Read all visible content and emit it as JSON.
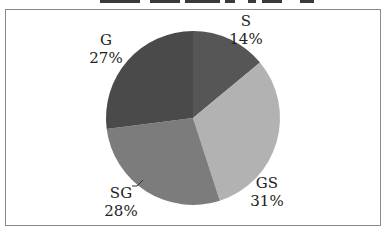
{
  "chart_data": {
    "type": "pie",
    "title": "",
    "categories": [
      "S",
      "GS",
      "SG",
      "G"
    ],
    "values": [
      14,
      31,
      28,
      27
    ],
    "unit": "%",
    "start_angle": "12 o'clock, clockwise",
    "colors": [
      "#565656",
      "#b2b2b2",
      "#7c7c7c",
      "#4a4a4a"
    ],
    "labels": [
      {
        "name": "S",
        "percent": "14%"
      },
      {
        "name": "GS",
        "percent": "31%"
      },
      {
        "name": "SG",
        "percent": "28%"
      },
      {
        "name": "G",
        "percent": "27%"
      }
    ],
    "legend": "none (labels placed outside slices)"
  }
}
